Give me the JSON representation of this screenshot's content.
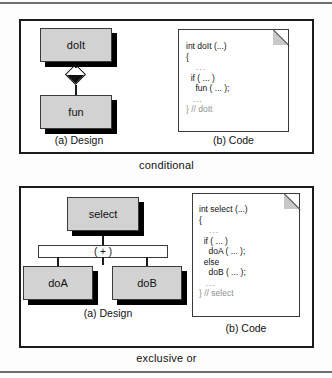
{
  "figure": {
    "panels": [
      {
        "id": "conditional",
        "caption": "conditional",
        "design": {
          "sub_caption": "(a) Design",
          "nodes": [
            {
              "label": "doIt"
            },
            {
              "label": "fun"
            }
          ],
          "connector": "aggregation-diamond"
        },
        "code": {
          "sub_caption": "(b) Code",
          "lines": [
            "int doIt (...)",
            "{",
            "   ...",
            "  if ( ... )",
            "    fun ( ... );",
            "  ...",
            "} // doIt"
          ],
          "signature": "int doIt (...)",
          "comment": "// doIt"
        }
      },
      {
        "id": "exclusive-or",
        "caption": "exclusive or",
        "design": {
          "sub_caption": "(a) Design",
          "nodes": [
            {
              "label": "select"
            },
            {
              "label": "doA"
            },
            {
              "label": "doB"
            }
          ],
          "connector": "xor-junction",
          "junction_marker": "( + )"
        },
        "code": {
          "sub_caption": "(b) Code",
          "lines": [
            "int select (...)",
            "{",
            "   ...",
            "  if ( ... )",
            "    doA ( ... );",
            "  else",
            "    doB ( ... );",
            "  ...",
            "} // select"
          ],
          "signature": "int select (...)",
          "comment": "// select"
        }
      }
    ]
  },
  "colors": {
    "node_fill": "#d2d2d2",
    "node_border": "#3a3a3a",
    "panel_border": "#1b1b1b",
    "shadow": "#000000",
    "fold": "#c8c8c8",
    "comment_text": "#8f8f8f",
    "page_rule": "#6e6e6e"
  }
}
